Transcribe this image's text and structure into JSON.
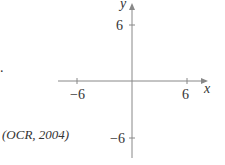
{
  "question": {
    "trailing_punct": ".",
    "source": "(OCR, 2004)"
  },
  "axes": {
    "x_label": "x",
    "y_label": "y",
    "x_ticks": [
      {
        "value": -6,
        "label": "−6"
      },
      {
        "value": 6,
        "label": "6"
      }
    ],
    "y_ticks": [
      {
        "value": 6,
        "label": "6"
      },
      {
        "value": -6,
        "label": "−6"
      }
    ],
    "color": "#888888"
  }
}
